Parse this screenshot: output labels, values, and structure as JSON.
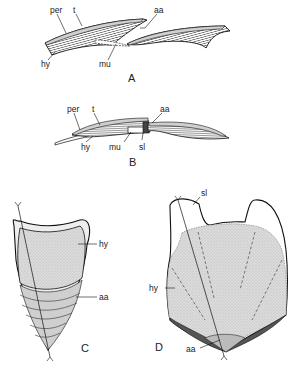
{
  "figure": {
    "panels": [
      {
        "id": "A",
        "label": "A",
        "view": "longitudinal section, scales separated",
        "labels": {
          "per": "per",
          "t": "t",
          "aa": "aa",
          "hy": "hy",
          "mu": "mu"
        }
      },
      {
        "id": "B",
        "label": "B",
        "view": "longitudinal section, scales overlapping",
        "labels": {
          "per": "per",
          "t": "t",
          "aa": "aa",
          "hy": "hy",
          "mu": "mu",
          "sl": "sl"
        }
      },
      {
        "id": "C",
        "label": "C",
        "view": "surface view of scale",
        "labels": {
          "hy": "hy",
          "aa": "aa"
        }
      },
      {
        "id": "D",
        "label": "D",
        "view": "surface view of scale",
        "labels": {
          "sl": "sl",
          "hy": "hy",
          "aa": "aa"
        }
      }
    ],
    "colors": {
      "ink": "#1a1a1a",
      "stipple": "#d4d4d4",
      "hatch": "#555555",
      "background": "#ffffff"
    }
  }
}
